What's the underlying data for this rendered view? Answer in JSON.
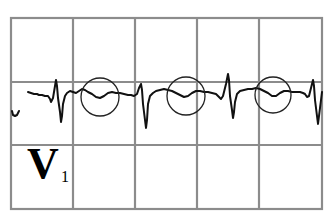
{
  "figure": {
    "type": "ECG lead strip",
    "lead": {
      "letter": "V",
      "subscript": "1"
    },
    "grid": {
      "columns": 5,
      "rows": 3,
      "line_color": "#8c8c8c",
      "x_lines": [
        11,
        73,
        135,
        197,
        259,
        322
      ],
      "y_lines": [
        18,
        82,
        145,
        209
      ]
    },
    "trace": {
      "color": "#111111",
      "beats": 4,
      "highlighted_regions": [
        {
          "label": "circle-1",
          "cx": 100,
          "cy": 97,
          "r": 19
        },
        {
          "label": "circle-2",
          "cx": 186,
          "cy": 96,
          "r": 19
        },
        {
          "label": "circle-3",
          "cx": 273,
          "cy": 95,
          "r": 18
        }
      ]
    }
  }
}
